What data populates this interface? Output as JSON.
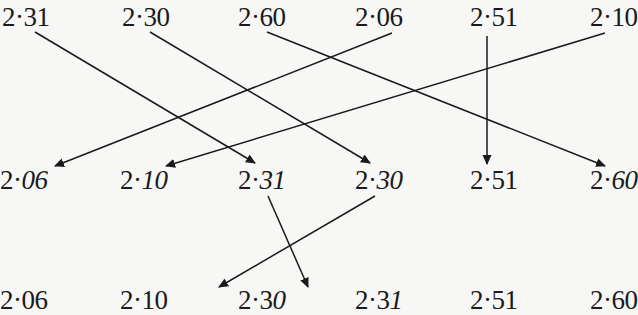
{
  "diagram": {
    "rows": [
      {
        "name": "original-order",
        "items": [
          {
            "int": "2·",
            "upright": "31",
            "italic": "",
            "x": 2
          },
          {
            "int": "2·",
            "upright": "30",
            "italic": "",
            "x": 122
          },
          {
            "int": "2·",
            "upright": "60",
            "italic": "",
            "x": 238
          },
          {
            "int": "2·",
            "upright": "06",
            "italic": "",
            "x": 355
          },
          {
            "int": "2·",
            "upright": "51",
            "italic": "",
            "x": 470
          },
          {
            "int": "2·",
            "upright": "10",
            "italic": "",
            "x": 590
          }
        ]
      },
      {
        "name": "sorted-by-tenths",
        "items": [
          {
            "int": "2·",
            "upright": "",
            "italic": "06",
            "x": 0
          },
          {
            "int": "2·",
            "upright": "",
            "italic": "10",
            "x": 120
          },
          {
            "int": "2·",
            "upright": "",
            "italic": "31",
            "x": 238
          },
          {
            "int": "2·",
            "upright": "",
            "italic": "30",
            "x": 355
          },
          {
            "int": "2·",
            "upright": "51",
            "italic": "",
            "x": 470
          },
          {
            "int": "2·",
            "upright": "",
            "italic": "60",
            "x": 590
          }
        ]
      },
      {
        "name": "sorted-by-hundredths",
        "items": [
          {
            "int": "2·",
            "upright": "06",
            "italic": "",
            "x": 0
          },
          {
            "int": "2·",
            "upright": "10",
            "italic": "",
            "x": 120
          },
          {
            "int": "2·",
            "upright": "3",
            "italic": "0",
            "x": 238
          },
          {
            "int": "2·",
            "upright": "3",
            "italic": "1",
            "x": 355
          },
          {
            "int": "2·",
            "upright": "51",
            "italic": "",
            "x": 470
          },
          {
            "int": "2·",
            "upright": "60",
            "italic": "",
            "x": 590
          }
        ]
      }
    ],
    "arrows": [
      {
        "from": "2·31 (row 1)",
        "to": "2·31 (row 2)",
        "x1": 35,
        "y1": 32,
        "x2": 255,
        "y2": 163
      },
      {
        "from": "2·30 (row 1)",
        "to": "2·30 (row 2)",
        "x1": 150,
        "y1": 32,
        "x2": 370,
        "y2": 163
      },
      {
        "from": "2·60 (row 1)",
        "to": "2·60 (row 2)",
        "x1": 267,
        "y1": 32,
        "x2": 605,
        "y2": 166
      },
      {
        "from": "2·06 (row 1)",
        "to": "2·06 (row 2)",
        "x1": 392,
        "y1": 33,
        "x2": 55,
        "y2": 166
      },
      {
        "from": "2·51 (row 1)",
        "to": "2·51 (row 2)",
        "x1": 487,
        "y1": 36,
        "x2": 487,
        "y2": 164
      },
      {
        "from": "2·10 (row 1)",
        "to": "2·10 (row 2)",
        "x1": 605,
        "y1": 33,
        "x2": 166,
        "y2": 166
      },
      {
        "from": "2·31 (row 2)",
        "to": "2·31 (row 3)",
        "x1": 268,
        "y1": 196,
        "x2": 308,
        "y2": 287
      },
      {
        "from": "2·30 (row 2)",
        "to": "2·30 (row 3)",
        "x1": 375,
        "y1": 196,
        "x2": 219,
        "y2": 287
      }
    ],
    "colors": {
      "ink": "#1a1a1a",
      "paper": "#f7f7f5"
    }
  }
}
